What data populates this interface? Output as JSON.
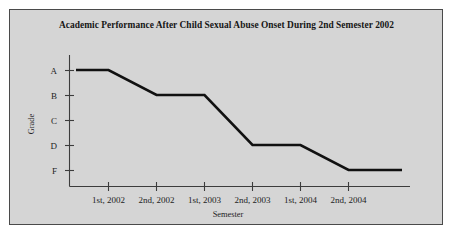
{
  "figure": {
    "background_color": "#d5d5d5",
    "border_color": "#4a4a4a",
    "page_color": "#ffffff"
  },
  "chart_data": {
    "type": "line",
    "title": "Academic Performance After Child Sexual Abuse Onset During 2nd Semester 2002",
    "xlabel": "Semester",
    "ylabel": "Grade",
    "categories": [
      "1st, 2002",
      "2nd, 2002",
      "1st, 2003",
      "2nd, 2003",
      "1st, 2004",
      "2nd, 2004"
    ],
    "ytick_labels": [
      "A",
      "B",
      "C",
      "D",
      "F"
    ],
    "yticks": [
      4,
      3,
      2,
      1,
      0
    ],
    "ylim": [
      -0.7,
      4.45
    ],
    "grid": false,
    "legend": null,
    "line_color": "#111111",
    "series": [
      {
        "name": "Grade",
        "x": [
          "1st, 2002",
          "2nd, 2002",
          "1st, 2003",
          "2nd, 2003",
          "1st, 2004",
          "2nd, 2004"
        ],
        "values": [
          "A",
          "B",
          "B",
          "D",
          "D",
          "F"
        ],
        "numeric_values": [
          4,
          3,
          3,
          1,
          1,
          0
        ]
      }
    ],
    "annotations": []
  },
  "axis_labels": {
    "y_axis_title": "Grade",
    "x_axis_title": "Semester"
  }
}
